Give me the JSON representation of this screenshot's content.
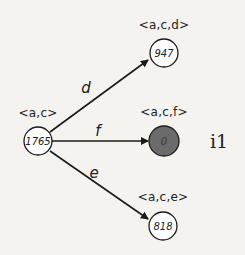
{
  "diagram": {
    "root": {
      "label": "<a,c>",
      "value": "1765",
      "filled": false
    },
    "children": [
      {
        "edge": "d",
        "label": "<a,c,d>",
        "value": "947",
        "filled": false
      },
      {
        "edge": "f",
        "label": "<a,c,f>",
        "value": "0",
        "filled": true
      },
      {
        "edge": "e",
        "label": "<a,c,e>",
        "value": "818",
        "filled": false
      }
    ],
    "side_label": "i1",
    "colors": {
      "line": "#1a1a1a",
      "filled_node": "#6b6b6b",
      "background": "#f4f3f0"
    }
  }
}
